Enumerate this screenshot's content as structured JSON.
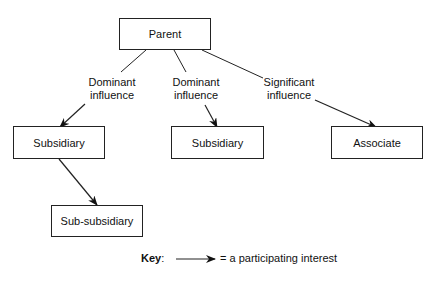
{
  "nodes": {
    "parent": "Parent",
    "subsidiary_left": "Subsidiary",
    "subsidiary_middle": "Subsidiary",
    "associate": "Associate",
    "sub_subsidiary": "Sub-subsidiary"
  },
  "edges": {
    "left": {
      "line1": "Dominant",
      "line2": "influence"
    },
    "middle": {
      "line1": "Dominant",
      "line2": "influence"
    },
    "right": {
      "line1": "Significant",
      "line2": "influence"
    }
  },
  "key": {
    "label": "Key",
    "colon": ":",
    "description": "= a participating interest"
  }
}
